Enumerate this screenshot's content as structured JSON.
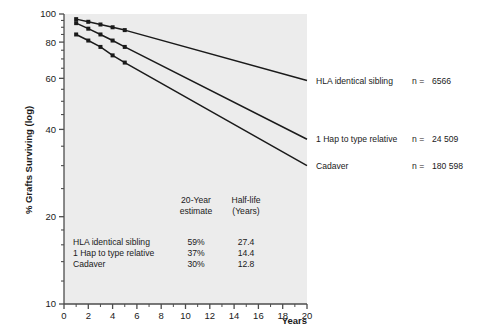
{
  "chart_data": {
    "type": "line",
    "title": "",
    "xlabel": "Years",
    "ylabel": "% Grafts Surviving (log)",
    "yscale": "log",
    "ylim": [
      10,
      100
    ],
    "xlim": [
      0,
      20
    ],
    "grid": false,
    "legend_position": "right-outside",
    "xticks": [
      0,
      2,
      4,
      6,
      8,
      10,
      12,
      14,
      16,
      18,
      20
    ],
    "xtick_labels": [
      "0",
      "2",
      "4",
      "6",
      "8",
      "10",
      "12",
      "14",
      "16",
      "18",
      "20"
    ],
    "yticks": [
      10,
      20,
      40,
      60,
      80,
      100
    ],
    "ytick_labels": [
      "10",
      "20",
      "40",
      "60",
      "80",
      "100"
    ],
    "y_minor_ticks": [
      12,
      14,
      16,
      18,
      25,
      30,
      35,
      45,
      50,
      55,
      65,
      70,
      75,
      85,
      90,
      95
    ],
    "series": [
      {
        "name": "HLA identical sibling",
        "n_label": "n =",
        "n_value": "6566",
        "marker": "filled-square",
        "x": [
          1,
          2,
          3,
          4,
          5,
          20
        ],
        "y": [
          96,
          94,
          92,
          90,
          88,
          59
        ],
        "markers_x": [
          1,
          2,
          3,
          4,
          5
        ],
        "markers_y": [
          96,
          94,
          92,
          90,
          88
        ]
      },
      {
        "name": "1 Hap to type relative",
        "n_label": "n =",
        "n_value": "24 509",
        "marker": "filled-square",
        "x": [
          1,
          2,
          3,
          4,
          5,
          20
        ],
        "y": [
          93,
          89,
          85,
          81,
          77,
          37
        ],
        "markers_x": [
          1,
          2,
          3,
          4,
          5
        ],
        "markers_y": [
          93,
          89,
          85,
          81,
          77
        ]
      },
      {
        "name": "Cadaver",
        "n_label": "n =",
        "n_value": "180 598",
        "marker": "filled-square",
        "x": [
          1,
          2,
          3,
          4,
          5,
          20
        ],
        "y": [
          85,
          81,
          77,
          72,
          68,
          30
        ],
        "markers_x": [
          1,
          2,
          3,
          4,
          5
        ],
        "markers_y": [
          85,
          81,
          77,
          72,
          68
        ]
      }
    ],
    "annotation_table": {
      "headers": [
        "",
        "20-Year\nestimate",
        "Half-life\n(Years)"
      ],
      "header_col2_line1": "20-Year",
      "header_col2_line2": "estimate",
      "header_col3_line1": "Half-life",
      "header_col3_line2": "(Years)",
      "rows": [
        {
          "label": "HLA identical sibling",
          "estimate": "59%",
          "halflife": "27.4"
        },
        {
          "label": "1 Hap to type relative",
          "estimate": "37%",
          "halflife": "14.4"
        },
        {
          "label": "Cadaver",
          "estimate": "30%",
          "halflife": "12.8"
        }
      ]
    },
    "colors": {
      "plot_background": "#ececec",
      "line": "#1a1a1a",
      "marker": "#1a1a1a",
      "axis": "#4d4d4d",
      "text": "#1a1a1a",
      "page_background": "#ffffff"
    }
  },
  "axis": {
    "y_title": "% Grafts Surviving (log)",
    "x_title": "Years"
  }
}
